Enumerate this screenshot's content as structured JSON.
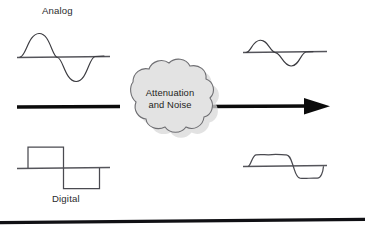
{
  "figure": {
    "background_color": "#ffffff"
  },
  "labels": {
    "analog": "Analog",
    "digital": "Digital"
  },
  "cloud": {
    "line1": "Attenuation",
    "line2": "and Noise",
    "fill_color": "#e3e3e3",
    "outline_color": "#6e6e72",
    "shadow_color": "#d8d8d8"
  },
  "arrow": {
    "color": "#0b0b0b",
    "direction": "left-to-right"
  },
  "rule": {
    "color": "#101014"
  },
  "waveforms": {
    "input_analog": {
      "kind": "sine",
      "state": "clean",
      "amplitude_px": 22,
      "baseline_y": 57,
      "x_start": 17,
      "x_end": 110,
      "stroke_color": "#3b3b40"
    },
    "output_analog": {
      "kind": "sine",
      "state": "attenuated",
      "amplitude_px": 12,
      "baseline_y": 52,
      "x_start": 243,
      "x_end": 327,
      "stroke_color": "#3b3b40"
    },
    "input_digital": {
      "kind": "square",
      "state": "clean",
      "amplitude_px": 21,
      "baseline_y": 168,
      "x_start": 17,
      "x_end": 110,
      "stroke_color": "#4a4a50"
    },
    "output_digital": {
      "kind": "square",
      "state": "degraded-rounded-noisy",
      "amplitude_px": 12,
      "baseline_y": 166,
      "x_start": 243,
      "x_end": 327,
      "stroke_color": "#4a4a50"
    }
  }
}
